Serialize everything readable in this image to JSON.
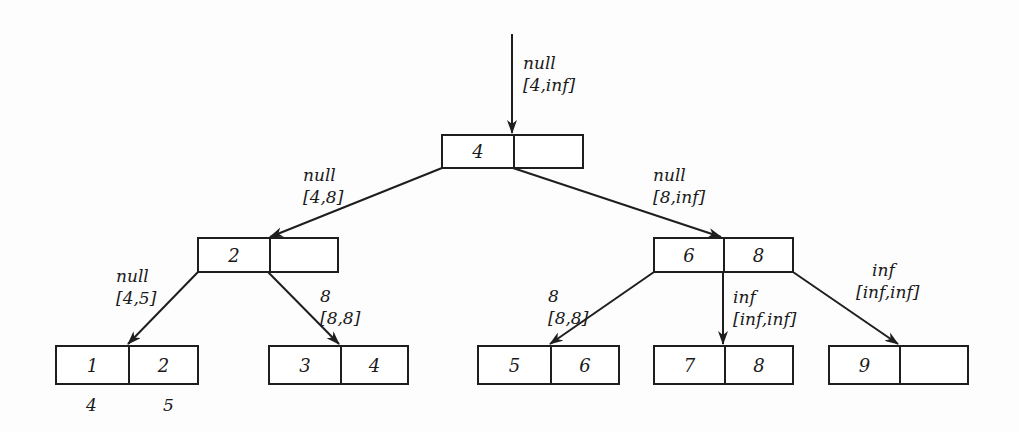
{
  "diagram": {
    "type": "b-tree with edge annotations",
    "colors": {
      "stroke": "#1e1e1e",
      "text": "#1a1a1a",
      "background": "#fdfdfd"
    },
    "nodes": [
      {
        "id": "root",
        "keys": [
          "4",
          ""
        ]
      },
      {
        "id": "n2",
        "keys": [
          "2",
          ""
        ]
      },
      {
        "id": "n68",
        "keys": [
          "6",
          "8"
        ]
      },
      {
        "id": "leaf12",
        "keys": [
          "1",
          "2"
        ],
        "below": [
          "4",
          "5"
        ]
      },
      {
        "id": "leaf34",
        "keys": [
          "3",
          "4"
        ]
      },
      {
        "id": "leaf56",
        "keys": [
          "5",
          "6"
        ]
      },
      {
        "id": "leaf78",
        "keys": [
          "7",
          "8"
        ]
      },
      {
        "id": "leaf9",
        "keys": [
          "9",
          ""
        ]
      }
    ],
    "edges": [
      {
        "id": "into-root",
        "to": "root",
        "value": "null",
        "range": "[4,inf]"
      },
      {
        "id": "root-n2",
        "from": "root",
        "to": "n2",
        "value": "null",
        "range": "[4,8]"
      },
      {
        "id": "root-n68",
        "from": "root",
        "to": "n68",
        "value": "null",
        "range": "[8,inf]"
      },
      {
        "id": "n2-leaf12",
        "from": "n2",
        "to": "leaf12",
        "value": "null",
        "range": "[4,5]"
      },
      {
        "id": "n2-leaf34",
        "from": "n2",
        "to": "leaf34",
        "value": "8",
        "range": "[8,8]"
      },
      {
        "id": "n68-leaf56",
        "from": "n68",
        "to": "leaf56",
        "value": "8",
        "range": "[8,8]"
      },
      {
        "id": "n68-leaf78",
        "from": "n68",
        "to": "leaf78",
        "value": "inf",
        "range": "[inf,inf]"
      },
      {
        "id": "n68-leaf9",
        "from": "n68",
        "to": "leaf9",
        "value": "inf",
        "range": "[inf,inf]"
      }
    ]
  }
}
